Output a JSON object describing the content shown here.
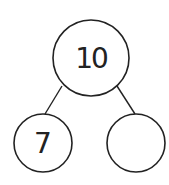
{
  "diagram": {
    "type": "number-bond",
    "whole": {
      "value": "10",
      "cx": 91,
      "cy": 58,
      "r": 38
    },
    "parts": [
      {
        "value": "7",
        "cx": 43,
        "cy": 143,
        "r": 29
      },
      {
        "value": "",
        "cx": 136,
        "cy": 143,
        "r": 29
      }
    ],
    "stroke_color": "#222222",
    "background": "#ffffff"
  }
}
